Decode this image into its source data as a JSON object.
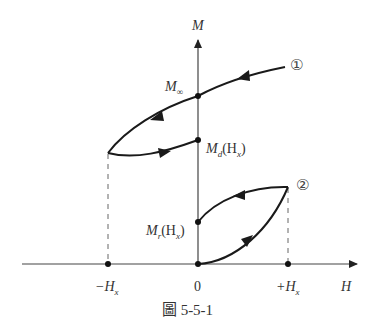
{
  "diagram": {
    "axes": {
      "y_label": "M",
      "x_label": "H"
    },
    "x_ticks": {
      "neg": "−H",
      "neg_sub": "x",
      "zero": "0",
      "pos": "+H",
      "pos_sub": "x"
    },
    "points": {
      "m_inf": "M",
      "m_inf_sub": "∞",
      "m_d": "M",
      "m_d_sub": "d",
      "m_d_arg": "(H",
      "m_d_arg_sub": "x",
      "m_d_close": ")",
      "m_r": "M",
      "m_r_sub": "r",
      "m_r_arg": "(H",
      "m_r_arg_sub": "x",
      "m_r_close": ")"
    },
    "curve_labels": {
      "curve1": "①",
      "curve2": "②"
    },
    "caption": "圖 5-5-1",
    "colors": {
      "curve": "#1a1a1a",
      "axis": "#444444",
      "dashed": "#666666"
    }
  }
}
